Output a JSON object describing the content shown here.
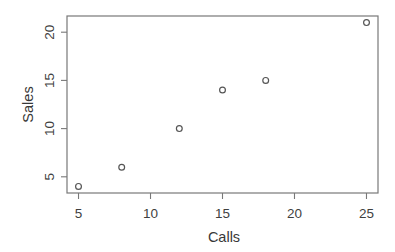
{
  "figure": {
    "kind": "scatter-plot-figure",
    "background": "#ffffff"
  },
  "chart_data": {
    "type": "scatter",
    "title": "",
    "xlabel": "Calls",
    "ylabel": "Sales",
    "x": [
      5,
      8,
      12,
      15,
      18,
      25
    ],
    "y": [
      4,
      6,
      10,
      14,
      15,
      21
    ],
    "points": [
      [
        5,
        4
      ],
      [
        8,
        6
      ],
      [
        12,
        10
      ],
      [
        15,
        14
      ],
      [
        18,
        15
      ],
      [
        25,
        21
      ]
    ],
    "x_ticks": [
      5,
      10,
      15,
      20,
      25
    ],
    "y_ticks": [
      5,
      10,
      15,
      20
    ],
    "xlim": [
      4.2,
      25.8
    ],
    "ylim": [
      3.32,
      21.68
    ],
    "grid": false,
    "legend": null,
    "marker": "open-circle",
    "colors": {
      "background": "#ffffff",
      "axis": "#787878",
      "tick": "#787878",
      "tick_text": "#3f3f3f",
      "label_text": "#383838",
      "marker": "#555555"
    }
  }
}
